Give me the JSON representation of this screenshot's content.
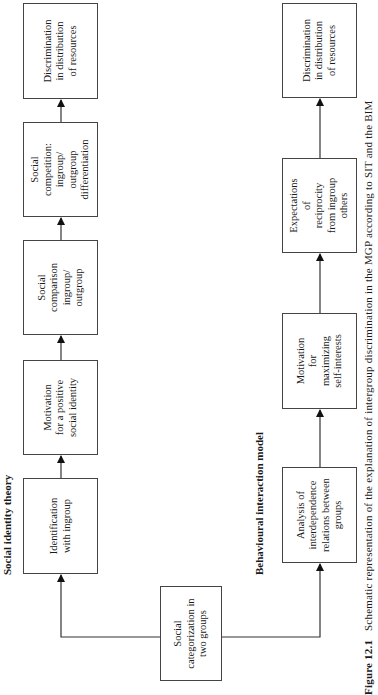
{
  "sit": {
    "title": "Social identity theory",
    "boxes": [
      {
        "text": "Identification\nwith ingroup"
      },
      {
        "text": "Motivation\nfor a positive\nsocial identity"
      },
      {
        "text": "Social\ncomparison\ningroup/\noutgroup"
      },
      {
        "text": "Social\ncompetition:\ningroup/\noutgroup\ndifferentiation"
      },
      {
        "text": "Discrimination\nin distribution\nof resources"
      }
    ]
  },
  "bim": {
    "title": "Behavioural interaction model",
    "boxes": [
      {
        "text": "Analysis of\ninterdependence\nrelations between\ngroups"
      },
      {
        "text": "Motivation\nfor\nmaximizing\nself-interests"
      },
      {
        "text": "Expectations\nof\nreciprocity\nfrom ingroup\nothers"
      },
      {
        "text": "Discrimination\nin distribution\nof resources"
      }
    ]
  },
  "root": {
    "text": "Social\ncategorization in\ntwo groups"
  },
  "caption": {
    "label": "Figure 12.1",
    "text": "Schematic representation of the explanation of intergroup discrimination in the MGP according to SIT and the BIM"
  }
}
